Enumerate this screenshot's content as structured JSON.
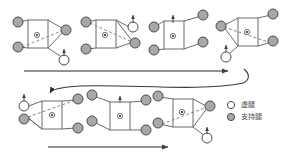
{
  "figure": {
    "colors": {
      "support_leg_fill": "#a8a8a8",
      "support_leg_stroke": "#4d4d4d",
      "swing_leg_fill": "#ffffff",
      "swing_leg_stroke": "#4d4d4d",
      "body_stroke": "#6b6b6b",
      "dashed_stroke": "#7a7a7a",
      "arrow_stroke": "#5a5a5a",
      "flow_arrow_stroke": "#555555",
      "text": "#4a4a4a",
      "background": "#ffffff"
    },
    "rows": [
      {
        "row_index": 0,
        "poses": [
          {
            "index": 1,
            "legs": [
              {
                "name": "left-front",
                "state": "support",
                "arrow": false
              },
              {
                "name": "left-rear",
                "state": "support",
                "arrow": false
              },
              {
                "name": "right-front",
                "state": "support",
                "arrow": false
              },
              {
                "name": "right-rear",
                "state": "swing",
                "arrow": true
              }
            ],
            "diagonal_dashed": true,
            "center_marker": true
          },
          {
            "index": 2,
            "legs": [
              {
                "name": "left-front",
                "state": "support",
                "arrow": false
              },
              {
                "name": "left-rear",
                "state": "support",
                "arrow": false
              },
              {
                "name": "right-front",
                "state": "swing",
                "arrow": true
              },
              {
                "name": "right-rear",
                "state": "support",
                "arrow": false
              }
            ],
            "diagonal_dashed": true,
            "center_marker": true
          },
          {
            "index": 3,
            "legs": [
              {
                "name": "left-front",
                "state": "support",
                "arrow": false
              },
              {
                "name": "left-rear",
                "state": "support",
                "arrow": false
              },
              {
                "name": "right-front",
                "state": "support",
                "arrow": false
              },
              {
                "name": "right-rear",
                "state": "support",
                "arrow": false
              }
            ],
            "diagonal_dashed": false,
            "center_marker": true
          },
          {
            "index": 4,
            "legs": [
              {
                "name": "left-front",
                "state": "support",
                "arrow": false
              },
              {
                "name": "left-rear",
                "state": "swing",
                "arrow": true
              },
              {
                "name": "right-front",
                "state": "support",
                "arrow": false
              },
              {
                "name": "right-rear",
                "state": "support",
                "arrow": false
              }
            ],
            "diagonal_dashed": true,
            "center_marker": true
          }
        ]
      },
      {
        "row_index": 1,
        "poses": [
          {
            "index": 5,
            "legs": [
              {
                "name": "left-front",
                "state": "swing",
                "arrow": true
              },
              {
                "name": "left-rear",
                "state": "support",
                "arrow": false
              },
              {
                "name": "right-front",
                "state": "support",
                "arrow": false
              },
              {
                "name": "right-rear",
                "state": "support",
                "arrow": false
              }
            ],
            "diagonal_dashed": true,
            "center_marker": true
          },
          {
            "index": 6,
            "legs": [
              {
                "name": "left-front",
                "state": "support",
                "arrow": false
              },
              {
                "name": "left-rear",
                "state": "support",
                "arrow": false
              },
              {
                "name": "right-front",
                "state": "support",
                "arrow": false
              },
              {
                "name": "right-rear",
                "state": "support",
                "arrow": false
              }
            ],
            "diagonal_dashed": false,
            "center_marker": true
          },
          {
            "index": 7,
            "legs": [
              {
                "name": "left-front",
                "state": "support",
                "arrow": false
              },
              {
                "name": "left-rear",
                "state": "support",
                "arrow": false
              },
              {
                "name": "right-front",
                "state": "support",
                "arrow": false
              },
              {
                "name": "right-rear",
                "state": "swing",
                "arrow": true
              }
            ],
            "diagonal_dashed": true,
            "center_marker": true
          }
        ]
      }
    ],
    "flow_arrows": [
      {
        "name": "row-1-progress-arrow",
        "direction": "right"
      },
      {
        "name": "row-wrap-connector-arrow",
        "direction": "wrap-down-left"
      },
      {
        "name": "row-2-progress-arrow",
        "direction": "right"
      }
    ],
    "legend": {
      "items": [
        {
          "symbol": "open-circle",
          "label": "虚腿"
        },
        {
          "symbol": "filled-circle",
          "label": "支持腿"
        }
      ]
    }
  }
}
